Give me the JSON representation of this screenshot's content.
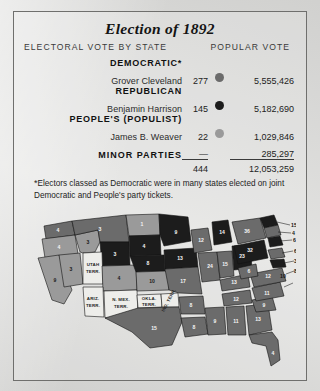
{
  "header": {
    "title": "Election of 1892",
    "col_electoral": "ELECTORAL VOTE BY STATE",
    "col_popular": "POPULAR VOTE"
  },
  "colors": {
    "democratic": "#6b6b6b",
    "republican": "#1c1c1c",
    "populist": "#9a9a9a",
    "unassigned": "#ededea",
    "paper": "#dcdcda",
    "ink": "#141414"
  },
  "table": {
    "rows": [
      {
        "party": "DEMOCRATIC*",
        "candidate": "Grover Cleveland",
        "electoral": "277",
        "popular": "5,555,426",
        "swatch": "democratic"
      },
      {
        "party": "REPUBLICAN",
        "candidate": "Benjamin Harrison",
        "electoral": "145",
        "popular": "5,182,690",
        "swatch": "republican"
      },
      {
        "party": "PEOPLE'S (POPULIST)",
        "candidate": "James B. Weaver",
        "electoral": "22",
        "popular": "1,029,846",
        "swatch": "populist"
      }
    ],
    "minor_label": "MINOR PARTIES",
    "minor_electoral": "—",
    "minor_popular": "285,297",
    "total_electoral": "444",
    "total_popular": "12,053,259"
  },
  "footnote": {
    "marker": "*",
    "text": "Electors classed as Democratic were in many states elected on joint Democratic and People's party tickets."
  },
  "map": {
    "territories": [
      {
        "name": "UTAH TERR.",
        "line1": "UTAH",
        "line2": "TERR."
      },
      {
        "name": "ARIZ. TERR.",
        "line1": "ARIZ.",
        "line2": "TERR."
      },
      {
        "name": "N. MEX. TERR.",
        "line1": "N. MEX.",
        "line2": "TERR."
      },
      {
        "name": "OKLA. TERR.",
        "line1": "OKLA.",
        "line2": "TERR."
      },
      {
        "name": "IND. TERR.",
        "line1": "IND. TERR.",
        "line2": ""
      }
    ],
    "states": [
      {
        "abbr": "WA",
        "votes": "4",
        "party": "democratic"
      },
      {
        "abbr": "OR",
        "votes": "4",
        "party": "split"
      },
      {
        "abbr": "CA",
        "votes": "9",
        "party": "split"
      },
      {
        "abbr": "NV",
        "votes": "3",
        "party": "populist"
      },
      {
        "abbr": "ID",
        "votes": "3",
        "party": "populist"
      },
      {
        "abbr": "MT",
        "votes": "3",
        "party": "democratic"
      },
      {
        "abbr": "WY",
        "votes": "3",
        "party": "republican"
      },
      {
        "abbr": "CO",
        "votes": "4",
        "party": "populist"
      },
      {
        "abbr": "ND",
        "votes": "1",
        "party": "split"
      },
      {
        "abbr": "SD",
        "votes": "4",
        "party": "republican"
      },
      {
        "abbr": "NE",
        "votes": "8",
        "party": "republican"
      },
      {
        "abbr": "KS",
        "votes": "10",
        "party": "populist"
      },
      {
        "abbr": "TX",
        "votes": "15",
        "party": "democratic"
      },
      {
        "abbr": "MN",
        "votes": "9",
        "party": "republican"
      },
      {
        "abbr": "IA",
        "votes": "13",
        "party": "republican"
      },
      {
        "abbr": "MO",
        "votes": "17",
        "party": "democratic"
      },
      {
        "abbr": "AR",
        "votes": "8",
        "party": "democratic"
      },
      {
        "abbr": "LA",
        "votes": "8",
        "party": "democratic"
      },
      {
        "abbr": "WI",
        "votes": "12",
        "party": "democratic"
      },
      {
        "abbr": "IL",
        "votes": "24",
        "party": "democratic"
      },
      {
        "abbr": "MI",
        "votes": "14",
        "party": "republican"
      },
      {
        "abbr": "IN",
        "votes": "15",
        "party": "democratic"
      },
      {
        "abbr": "OH",
        "votes": "23",
        "party": "republican"
      },
      {
        "abbr": "KY",
        "votes": "13",
        "party": "democratic"
      },
      {
        "abbr": "TN",
        "votes": "12",
        "party": "democratic"
      },
      {
        "abbr": "MS",
        "votes": "9",
        "party": "democratic"
      },
      {
        "abbr": "AL",
        "votes": "11",
        "party": "democratic"
      },
      {
        "abbr": "GA",
        "votes": "13",
        "party": "democratic"
      },
      {
        "abbr": "FL",
        "votes": "4",
        "party": "democratic"
      },
      {
        "abbr": "SC",
        "votes": "9",
        "party": "democratic"
      },
      {
        "abbr": "NC",
        "votes": "11",
        "party": "democratic"
      },
      {
        "abbr": "VA",
        "votes": "12",
        "party": "democratic"
      },
      {
        "abbr": "WV",
        "votes": "6",
        "party": "democratic"
      },
      {
        "abbr": "PA",
        "votes": "32",
        "party": "republican"
      },
      {
        "abbr": "NY",
        "votes": "36",
        "party": "democratic"
      }
    ],
    "leader_numbers": [
      "15",
      "4",
      "6",
      "10",
      "6",
      "3",
      "8"
    ]
  }
}
